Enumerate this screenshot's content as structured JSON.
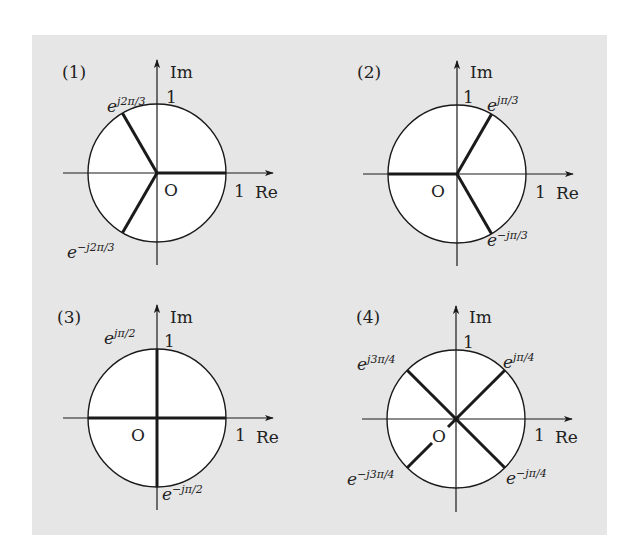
{
  "figure": {
    "background_color": "#e6e6e6",
    "panel": {
      "x": 32,
      "y": 35,
      "width": 575,
      "height": 500
    },
    "circle_fill": "#ffffff",
    "stroke_color": "#1a1a1a",
    "radius_px": 69
  },
  "diagrams": [
    {
      "id": "1",
      "label": "(1)",
      "center": [
        157,
        173
      ],
      "axis_labels": {
        "im": "Im",
        "re": "Re",
        "origin": "O",
        "im_unit": "1",
        "re_unit": "1"
      },
      "phasors": [
        {
          "angle_deg": 0,
          "label_base": "",
          "label_sup": ""
        },
        {
          "angle_deg": 120,
          "label_base": "e",
          "label_sup": "j2π/3"
        },
        {
          "angle_deg": -120,
          "label_base": "e",
          "label_sup": "−j2π/3"
        }
      ]
    },
    {
      "id": "2",
      "label": "(2)",
      "center": [
        457,
        174
      ],
      "axis_labels": {
        "im": "Im",
        "re": "Re",
        "origin": "O",
        "im_unit": "1",
        "re_unit": "1"
      },
      "phasors": [
        {
          "angle_deg": 180,
          "label_base": "",
          "label_sup": ""
        },
        {
          "angle_deg": 60,
          "label_base": "e",
          "label_sup": "jπ/3"
        },
        {
          "angle_deg": -60,
          "label_base": "e",
          "label_sup": "−jπ/3"
        }
      ]
    },
    {
      "id": "3",
      "label": "(3)",
      "center": [
        157,
        418
      ],
      "axis_labels": {
        "im": "Im",
        "re": "Re",
        "origin": "O",
        "im_unit": "1",
        "re_unit": "1"
      },
      "phasors": [
        {
          "angle_deg": 0,
          "label_base": "",
          "label_sup": ""
        },
        {
          "angle_deg": 180,
          "label_base": "",
          "label_sup": ""
        },
        {
          "angle_deg": 90,
          "label_base": "e",
          "label_sup": "jπ/2"
        },
        {
          "angle_deg": -90,
          "label_base": "e",
          "label_sup": "−jπ/2"
        }
      ]
    },
    {
      "id": "4",
      "label": "(4)",
      "center": [
        456,
        419
      ],
      "axis_labels": {
        "im": "Im",
        "re": "Re",
        "origin": "O",
        "im_unit": "1",
        "re_unit": "1"
      },
      "phasors": [
        {
          "angle_deg": 45,
          "label_base": "e",
          "label_sup": "jπ/4"
        },
        {
          "angle_deg": 135,
          "label_base": "e",
          "label_sup": "j3π/4"
        },
        {
          "angle_deg": -45,
          "label_base": "e",
          "label_sup": "−jπ/4"
        },
        {
          "angle_deg": -135,
          "label_base": "e",
          "label_sup": "−j3π/4"
        }
      ]
    }
  ]
}
